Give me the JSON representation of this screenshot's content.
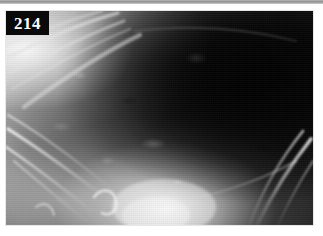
{
  "figure": {
    "label": "214",
    "label_position": "top-left",
    "modality": "radiograph",
    "view": "lateral thorax",
    "colorspace": "grayscale"
  },
  "colors": {
    "label_background": "#0a0a0a",
    "label_text": "#ffffff",
    "page_background": "#ffffff",
    "top_rule": "#8e8e8e",
    "panel_border": "#e6e6e6",
    "bone_bright": "#f2f2f2",
    "lung_dark": "#111111",
    "soft_tissue_mid": "#8a8a8a"
  },
  "regions": [
    {
      "name": "scapula-shoulder-bright-field",
      "tone": "bright",
      "location": "upper-left"
    },
    {
      "name": "lung-field-lucent",
      "tone": "dark",
      "location": "upper-right"
    },
    {
      "name": "rib-cage-cranial",
      "tone": "bright-linear",
      "location": "left"
    },
    {
      "name": "rib-cage-caudal",
      "tone": "bright-linear",
      "location": "lower-right"
    },
    {
      "name": "sternal-cardiac-opacity",
      "tone": "bright-diffuse",
      "location": "bottom-center"
    },
    {
      "name": "pulmonary-vascular-markings",
      "tone": "mottled",
      "location": "center"
    }
  ]
}
